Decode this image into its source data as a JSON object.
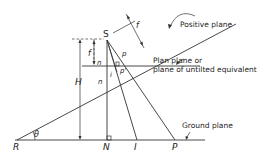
{
  "diagram": {
    "type": "tilted-photo-geometry",
    "points": {
      "S": "S",
      "R": "R",
      "N": "N",
      "I": "I",
      "P": "P",
      "p_upper": "p",
      "p_lower": "p'",
      "n": "n",
      "i": "i",
      "n_lower": "n"
    },
    "dimensions": {
      "focal_left": "f",
      "focal_tilted": "f",
      "height": "H",
      "angle": "θ"
    },
    "labels": {
      "positive_plane": "Positive plane",
      "plan_plane_line1": "Plan plane  or",
      "plan_plane_line2": "plane of untilted equivalent",
      "ground_plane": "Ground plane"
    }
  }
}
